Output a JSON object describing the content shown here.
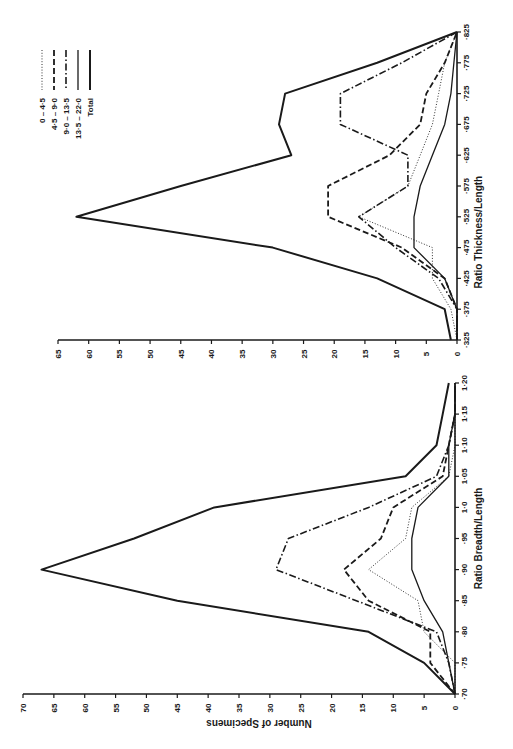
{
  "page": {
    "running_header": ""
  },
  "chart_data": [
    {
      "type": "line",
      "title": "",
      "orientation": "rotated 90° (categories run vertically along right axis, bottom to top; counts run right to left)",
      "xlabel": "Ratio Thickness/Length",
      "ylabel": "",
      "categories": [
        "·325",
        "·375",
        "·425",
        "·475",
        "·525",
        "·575",
        "·625",
        "·675",
        "·725",
        "·775",
        "·825"
      ],
      "y_ticks": [
        "0",
        "5",
        "10",
        "15",
        "20",
        "25",
        "30",
        "35",
        "40",
        "45",
        "50",
        "55",
        "60",
        "65"
      ],
      "ylim": [
        0,
        65
      ],
      "grid": false,
      "legend_position": "upper-left (rotated)",
      "series": [
        {
          "name": "0 – 4·5",
          "style": "dotted",
          "values": [
            0,
            1,
            4,
            4,
            16,
            8,
            6,
            4,
            3,
            2,
            0
          ]
        },
        {
          "name": "4·5 – 9·0",
          "style": "dashed",
          "values": [
            0,
            0,
            2,
            9,
            21,
            21,
            11,
            6,
            5,
            2,
            0
          ]
        },
        {
          "name": "9·0 – 13·5",
          "style": "dash-dot",
          "values": [
            0,
            0,
            3,
            10,
            16,
            8,
            8,
            19,
            19,
            9,
            0
          ]
        },
        {
          "name": "13·5 – 22·0",
          "style": "solid-thin",
          "values": [
            0,
            0,
            2,
            7,
            7,
            6,
            4,
            2,
            1,
            0.5,
            0
          ]
        },
        {
          "name": "Total",
          "style": "solid-thick",
          "values": [
            1,
            2,
            13,
            30,
            62,
            45,
            27,
            29,
            28,
            13,
            0
          ]
        }
      ]
    },
    {
      "type": "line",
      "title": "",
      "orientation": "rotated 90° (categories run vertically along right axis, bottom to top; counts run right to left)",
      "xlabel": "Ratio Breadth/Length",
      "ylabel": "Number of Specimens",
      "categories": [
        "·70",
        "·75",
        "·80",
        "·85",
        "·90",
        "·95",
        "1·0",
        "1·05",
        "1·10",
        "1·15",
        "1·20"
      ],
      "y_ticks": [
        "0",
        "5",
        "10",
        "15",
        "20",
        "25",
        "30",
        "35",
        "40",
        "45",
        "50",
        "55",
        "60",
        "65",
        "70"
      ],
      "ylim": [
        0,
        70
      ],
      "grid": false,
      "series": [
        {
          "name": "0 – 4·5",
          "style": "dotted",
          "values": [
            0,
            0,
            5,
            6,
            14,
            8,
            7,
            1,
            0,
            0,
            0
          ]
        },
        {
          "name": "4·5 – 9·0",
          "style": "dashed",
          "values": [
            0,
            4,
            4,
            14,
            18,
            12,
            10,
            2,
            1,
            0,
            0
          ]
        },
        {
          "name": "9·0 – 13·5",
          "style": "dash-dot",
          "values": [
            0,
            1,
            3,
            16,
            29,
            27,
            14,
            3,
            1,
            0,
            0
          ]
        },
        {
          "name": "13·5 – 22·0",
          "style": "solid-thin",
          "values": [
            0,
            1,
            2,
            5,
            7,
            7,
            6,
            1,
            1,
            0,
            0
          ]
        },
        {
          "name": "Total",
          "style": "solid-thick",
          "values": [
            0,
            5,
            14,
            45,
            67,
            52,
            39,
            8,
            3,
            2,
            1
          ]
        }
      ]
    }
  ],
  "legend": {
    "entries": [
      {
        "label": "0 – 4·5",
        "style": "dotted"
      },
      {
        "label": "4·5 – 9·0",
        "style": "dashed"
      },
      {
        "label": "9·0 – 13·5",
        "style": "dash-dot"
      },
      {
        "label": "13·5 – 22·0",
        "style": "solid-thin"
      },
      {
        "label": "Total",
        "style": "solid-thick"
      }
    ]
  },
  "styles": {
    "ink": "#1a1a1a",
    "paper": "#ffffff"
  }
}
